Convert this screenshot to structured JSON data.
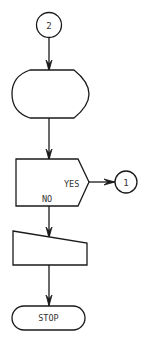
{
  "diagram": {
    "type": "flowchart",
    "nodes": [
      {
        "id": "conn2",
        "shape": "connector-circle",
        "label": "2"
      },
      {
        "id": "display",
        "shape": "display",
        "label": ""
      },
      {
        "id": "decision",
        "shape": "decision-pentagon",
        "label": "",
        "yes_label": "YES",
        "no_label": "NO"
      },
      {
        "id": "conn1",
        "shape": "connector-circle",
        "label": "1"
      },
      {
        "id": "manual_input",
        "shape": "manual-input",
        "label": ""
      },
      {
        "id": "stop",
        "shape": "terminator",
        "label": "STOP"
      }
    ],
    "edges": [
      {
        "from": "conn2",
        "to": "display"
      },
      {
        "from": "display",
        "to": "decision"
      },
      {
        "from": "decision",
        "to": "conn1",
        "label": "YES"
      },
      {
        "from": "decision",
        "to": "manual_input",
        "label": "NO"
      },
      {
        "from": "manual_input",
        "to": "stop"
      }
    ],
    "colors": {
      "stroke": "#1a1a1a",
      "fill": "#ffffff",
      "text": "#333333"
    }
  }
}
